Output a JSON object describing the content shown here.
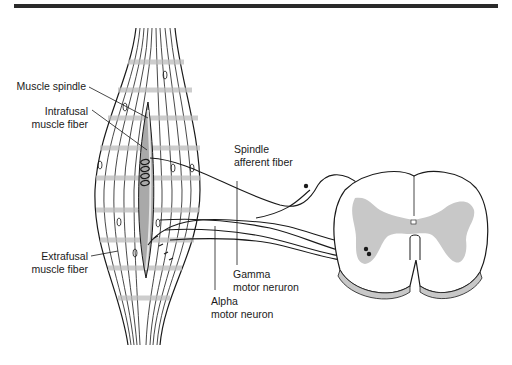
{
  "figure": {
    "labels": {
      "muscle_spindle": "Muscle spindle",
      "intrafusal_line1": "Intrafusal",
      "intrafusal_line2": "muscle fiber",
      "extrafusal_line1": "Extrafusal",
      "extrafusal_line2": "muscle fiber",
      "spindle_afferent_line1": "Spindle",
      "spindle_afferent_line2": "afferent fiber",
      "gamma_line1": "Gamma",
      "gamma_line2": "motor neruron",
      "alpha_line1": "Alpha",
      "alpha_line2": "motor neuron"
    },
    "colors": {
      "ink": "#1a1a1a",
      "gray_matter": "#c8c8c8",
      "spindle_fill": "#a9a9a9",
      "striation": "#bdbdbd",
      "rule": "#2a2a2a"
    }
  }
}
